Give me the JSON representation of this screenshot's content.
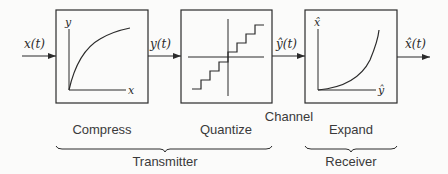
{
  "diagram": {
    "signals": {
      "input": "x(t)",
      "compressed": "y(t)",
      "quantized": "ŷ(t)",
      "output": "x̂(t)"
    },
    "blocks": [
      {
        "id": "compress",
        "label": "Compress",
        "axis_y": "y",
        "axis_x": "x",
        "curve": "concave-log"
      },
      {
        "id": "quantize",
        "label": "Quantize",
        "curve": "staircase"
      },
      {
        "id": "expand",
        "label": "Expand",
        "axis_y": "x̂",
        "axis_x": "ŷ",
        "curve": "convex-exp"
      }
    ],
    "channel_label": "Channel",
    "groups": [
      {
        "label": "Transmitter",
        "spans": [
          "compress",
          "quantize"
        ]
      },
      {
        "label": "Receiver",
        "spans": [
          "expand"
        ]
      }
    ]
  },
  "colors": {
    "line": "#2b2b2b",
    "text": "#3a3a3a",
    "background": "#fbfbfa"
  }
}
